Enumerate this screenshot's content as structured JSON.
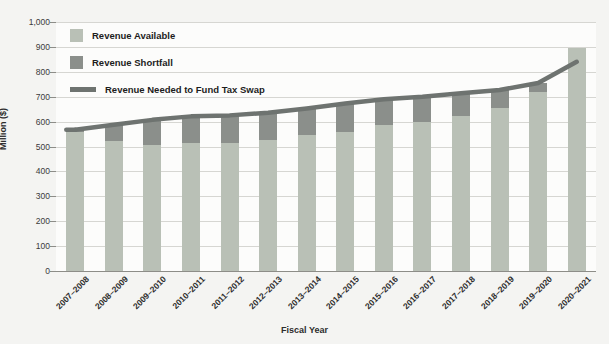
{
  "chart_data": {
    "type": "bar",
    "title": "",
    "xlabel": "Fiscal Year",
    "ylabel": "Million ($)",
    "ylim": [
      0,
      1000
    ],
    "ytick_step": 100,
    "grid": true,
    "legend_position": "upper-left-inside",
    "categories": [
      "2007–2008",
      "2008–2009",
      "2009–2010",
      "2010–2011",
      "2011–2012",
      "2012–2013",
      "2013–2014",
      "2014–2015",
      "2015–2016",
      "2016–2017",
      "2017–2018",
      "2018–2019",
      "2019–2020",
      "2020–2021"
    ],
    "series": [
      {
        "name": "Revenue Available",
        "type": "bar-segment",
        "color": "#b9c0b6",
        "values": [
          557,
          522,
          507,
          513,
          513,
          528,
          548,
          560,
          588,
          600,
          622,
          655,
          720,
          895
        ]
      },
      {
        "name": "Revenue Shortfall",
        "type": "bar-segment",
        "color": "#8b8f8b",
        "values": [
          10,
          65,
          100,
          108,
          112,
          108,
          105,
          113,
          102,
          100,
          92,
          72,
          35,
          0
        ]
      },
      {
        "name": "Revenue Needed to Fund Tax Swap",
        "type": "line",
        "color": "#6e7370",
        "values": [
          567,
          587,
          607,
          621,
          625,
          636,
          653,
          673,
          690,
          700,
          714,
          727,
          755,
          840
        ]
      }
    ],
    "bar_totals": [
      567,
      587,
      607,
      621,
      625,
      636,
      653,
      673,
      690,
      700,
      714,
      727,
      755,
      895
    ],
    "ytick_labels": [
      "1,000",
      "900",
      "800",
      "700",
      "600",
      "500",
      "400",
      "300",
      "200",
      "100",
      "0"
    ],
    "ytick_values": [
      1000,
      900,
      800,
      700,
      600,
      500,
      400,
      300,
      200,
      100,
      0
    ]
  },
  "legend": {
    "items": [
      {
        "label": "Revenue Available",
        "swatch": "available"
      },
      {
        "label": "Revenue Shortfall",
        "swatch": "shortfall"
      },
      {
        "label": "Revenue Needed to Fund Tax Swap",
        "swatch": "line"
      }
    ]
  },
  "axes": {
    "y_title": "Million ($)",
    "x_title": "Fiscal Year"
  }
}
